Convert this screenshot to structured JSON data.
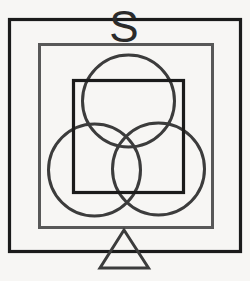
{
  "figure": {
    "background_color": "#f7f6f4",
    "canvas": {
      "width": 250,
      "height": 281
    },
    "letter_label": {
      "text": "S",
      "name": "letter-s-glyph",
      "x": 124,
      "y": 42,
      "font_size": 44,
      "color": "#2b2b2b"
    },
    "shapes": {
      "outer_square": {
        "label": "Outer black square",
        "x": 9.5,
        "y": 19.5,
        "width": 231,
        "height": 232,
        "stroke": "#1b1b1b",
        "stroke_width": 3.2,
        "fill": "none"
      },
      "middle_square": {
        "label": "Middle gray square",
        "x": 39.5,
        "y": 44.5,
        "width": 173,
        "height": 183,
        "stroke": "#585858",
        "stroke_width": 3.0,
        "fill": "none"
      },
      "inner_square": {
        "label": "Inner black square",
        "x": 73.5,
        "y": 80.5,
        "width": 110,
        "height": 112,
        "stroke": "#1b1b1b",
        "stroke_width": 3.2,
        "fill": "none"
      },
      "circles": [
        {
          "label": "Top circle",
          "name": "circle-top",
          "cx": 128.5,
          "cy": 101,
          "r": 46,
          "stroke": "#3c3c3c",
          "stroke_width": 3.0,
          "fill": "none"
        },
        {
          "label": "Lower left circle",
          "name": "circle-lower-left",
          "cx": 94.5,
          "cy": 170,
          "r": 46,
          "stroke": "#3c3c3c",
          "stroke_width": 3.0,
          "fill": "none"
        },
        {
          "label": "Lower right circle",
          "name": "circle-lower-right",
          "cx": 158.5,
          "cy": 169,
          "r": 46,
          "stroke": "#3c3c3c",
          "stroke_width": 3.0,
          "fill": "none"
        }
      ],
      "triangle": {
        "label": "Bottom triangle",
        "points": "124,230 148.5,268 100,268",
        "stroke": "#3c3c3c",
        "stroke_width": 3.0,
        "fill": "none"
      }
    }
  }
}
